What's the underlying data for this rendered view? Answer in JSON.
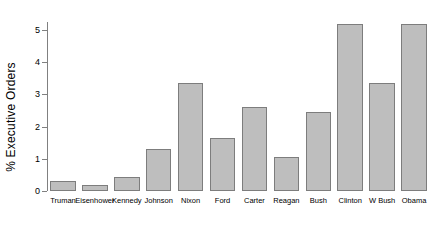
{
  "chart_data": {
    "type": "bar",
    "title": "",
    "xlabel": "",
    "ylabel": "% Executive Orders",
    "categories": [
      "Truman",
      "Eisenhower",
      "Kennedy",
      "Johnson",
      "Nixon",
      "Ford",
      "Carter",
      "Reagan",
      "Bush",
      "Clinton",
      "W Bush",
      "Obama"
    ],
    "values": [
      0.3,
      0.2,
      0.45,
      1.3,
      3.35,
      1.65,
      2.6,
      1.05,
      2.45,
      5.2,
      3.35,
      5.2
    ],
    "ylim": [
      0,
      5.25
    ],
    "yticks": [
      0,
      1,
      2,
      3,
      4,
      5
    ],
    "ytick_labels": [
      "0",
      "1",
      "2",
      "3",
      "4",
      "5"
    ],
    "grid": false,
    "legend": false,
    "bar_color": "#bebebe",
    "bar_border_color": "#7d7d7d",
    "axis_color": "#808080"
  }
}
